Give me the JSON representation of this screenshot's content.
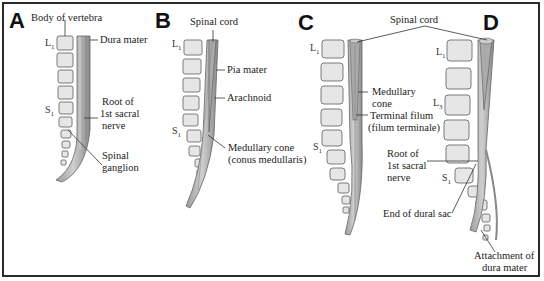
{
  "figure": {
    "panels": [
      {
        "letter": "A",
        "vertebra_labels": {
          "top": "L",
          "top_sub": "1",
          "bottom": "S",
          "bottom_sub": "1"
        },
        "labels": {
          "body_of_vertebra": "Body of vertebra",
          "dura_mater": "Dura mater",
          "root_line1": "Root of",
          "root_line2": "1st sacral",
          "root_line3": "nerve",
          "ganglion_line1": "Spinal",
          "ganglion_line2": "ganglion"
        }
      },
      {
        "letter": "B",
        "vertebra_labels": {
          "top": "L",
          "top_sub": "1",
          "bottom": "S",
          "bottom_sub": "1"
        },
        "labels": {
          "spinal_cord": "Spinal cord",
          "pia_mater": "Pia mater",
          "arachnoid": "Arachnoid",
          "cone_line1": "Medullary cone",
          "cone_line2": "(conus medullaris)"
        }
      },
      {
        "letter": "C",
        "vertebra_labels": {
          "top": "L",
          "top_sub": "1",
          "bottom": "S",
          "bottom_sub": "1"
        },
        "labels": {
          "cone_line1": "Medullary",
          "cone_line2": "cone",
          "filum_line1": "Terminal filum",
          "filum_line2": "(filum terminale)"
        }
      },
      {
        "letter": "D",
        "vertebra_labels": {
          "top": "L",
          "top_sub": "1",
          "mid": "L",
          "mid_sub": "3",
          "bottom": "S",
          "bottom_sub": "1"
        },
        "labels": {
          "root_line1": "Root of",
          "root_line2": "1st sacral",
          "root_line3": "nerve",
          "dural_sac": "End of dural sac",
          "attach_line1": "Attachment of",
          "attach_line2": "dura mater"
        }
      }
    ],
    "shared_labels": {
      "spinal_cord": "Spinal cord"
    }
  }
}
